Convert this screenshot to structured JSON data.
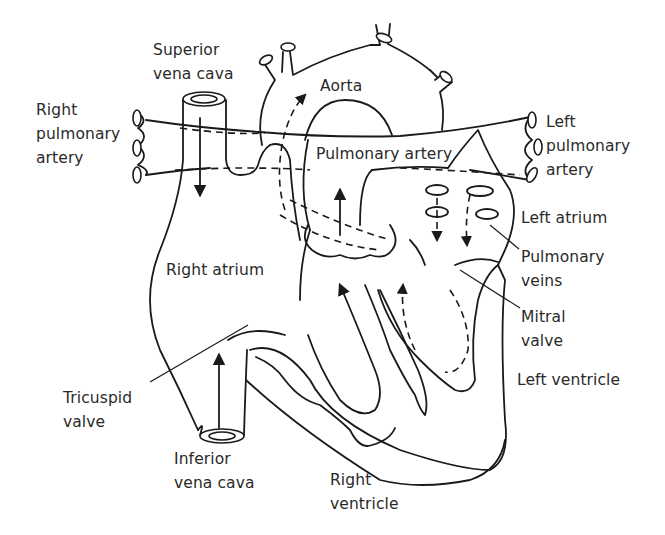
{
  "diagram": {
    "type": "anatomical-line-drawing",
    "line_color": "#1a1a1a",
    "text_color": "#2a2a2a",
    "background": "#ffffff",
    "labels": {
      "superior_vena_cava": "Superior\nvena cava",
      "aorta": "Aorta",
      "right_pulmonary_artery": "Right\npulmonary\nartery",
      "left_pulmonary_artery": "Left\npulmonary\nartery",
      "pulmonary_artery": "Pulmonary artery",
      "left_atrium": "Left atrium",
      "pulmonary_veins": "Pulmonary\nveins",
      "right_atrium": "Right atrium",
      "mitral_valve": "Mitral\nvalve",
      "left_ventricle": "Left ventricle",
      "tricuspid_valve": "Tricuspid\nvalve",
      "inferior_vena_cava": "Inferior\nvena cava",
      "right_ventricle": "Right\nventricle"
    },
    "flow_arrows": [
      {
        "from": "superior_vena_cava",
        "to": "right_atrium",
        "style": "solid"
      },
      {
        "from": "inferior_vena_cava",
        "to": "right_atrium",
        "style": "solid"
      },
      {
        "from": "right_ventricle",
        "to": "pulmonary_artery",
        "style": "solid"
      },
      {
        "from": "pulmonary_veins",
        "to": "left_atrium",
        "style": "dashed"
      },
      {
        "from": "left_ventricle",
        "to": "aorta",
        "style": "dashed"
      }
    ]
  }
}
